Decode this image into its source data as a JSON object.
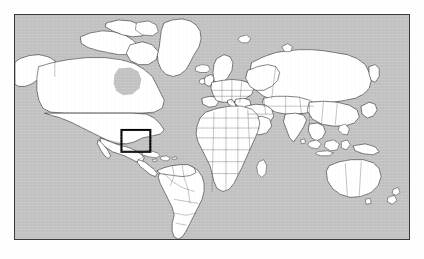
{
  "figure": {
    "kind": "world-map-locator",
    "title": "",
    "caption": "",
    "projection": "equirectangular"
  },
  "map": {
    "frame": {
      "x": 14,
      "y": 14,
      "width": 396,
      "height": 226,
      "border_color": "#3a3a3a",
      "border_width_px": 1
    },
    "ocean_color": "#c2c2c2",
    "land_color": "#ffffff",
    "coastline_color": "#1a1a1a",
    "country_border_color": "#5c5c5c",
    "background_color": "#fefefe",
    "extent": {
      "lon_min": -180,
      "lon_max": 180,
      "lat_min": -60,
      "lat_max": 84
    },
    "graticule_visible": false,
    "labels": []
  },
  "highlight": {
    "shape": "rectangle",
    "color": "#000000",
    "stroke_width_px": 2,
    "region_name": "Caribbean / Central America",
    "pixel_box": {
      "x": 122,
      "y": 131,
      "width": 29,
      "height": 22
    },
    "lonlat_box": {
      "lon_min": -88,
      "lon_max": -62,
      "lat_min": 11,
      "lat_max": 26
    }
  },
  "continents": [
    "North America",
    "South America",
    "Europe",
    "Africa",
    "Asia",
    "Australia",
    "Greenland"
  ]
}
